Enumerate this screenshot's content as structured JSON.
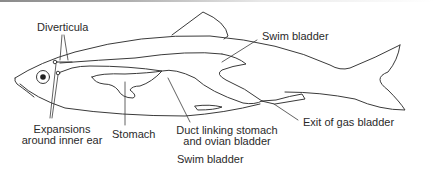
{
  "diagram": {
    "caption": "Swim bladder",
    "labels": {
      "diverticula": "Diverticula",
      "swim_bladder": "Swim bladder",
      "expansions_line1": "Expansions",
      "expansions_line2": "around inner ear",
      "stomach": "Stomach",
      "duct_line1": "Duct linking stomach",
      "duct_line2": "and ovian bladder",
      "exit": "Exit of gas bladder"
    },
    "colors": {
      "stroke": "#3a3a3a",
      "text": "#2a2a2a",
      "background": "#ffffff"
    }
  }
}
